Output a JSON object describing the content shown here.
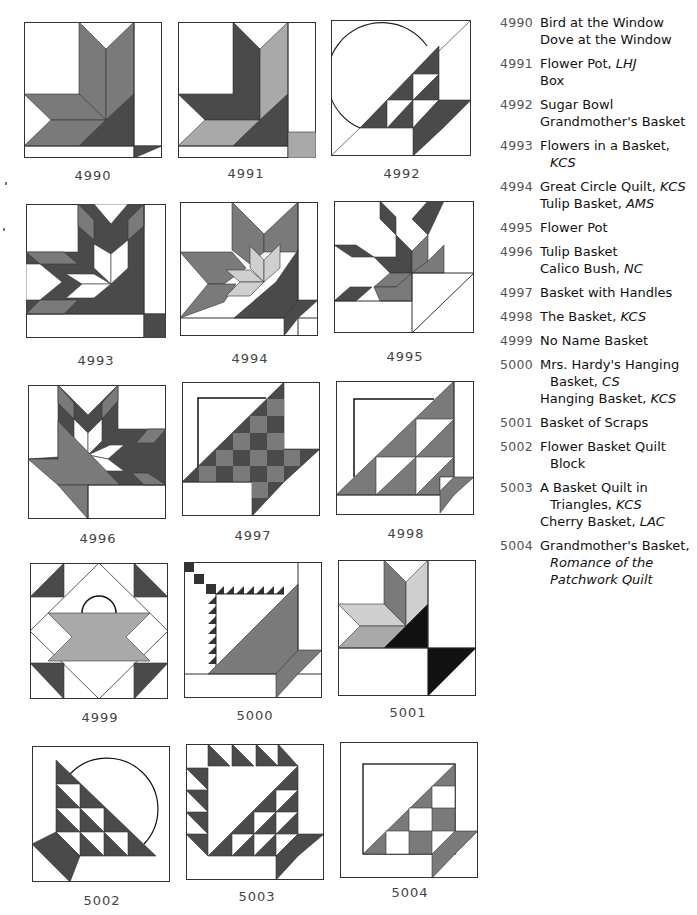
{
  "colors": {
    "dark": "#4a4a4a",
    "medium": "#7a7a7a",
    "light": "#a9a9a9",
    "pale": "#cfcfcf",
    "black": "#111111",
    "outline": "#333333",
    "background": "#ffffff"
  },
  "blocks": [
    {
      "number": "4990",
      "row": 0,
      "col": 0
    },
    {
      "number": "4991",
      "row": 0,
      "col": 1
    },
    {
      "number": "4992",
      "row": 0,
      "col": 2
    },
    {
      "number": "4993",
      "row": 1,
      "col": 0
    },
    {
      "number": "4994",
      "row": 1,
      "col": 1
    },
    {
      "number": "4995",
      "row": 1,
      "col": 2
    },
    {
      "number": "4996",
      "row": 2,
      "col": 0
    },
    {
      "number": "4997",
      "row": 2,
      "col": 1
    },
    {
      "number": "4998",
      "row": 2,
      "col": 2
    },
    {
      "number": "4999",
      "row": 3,
      "col": 0
    },
    {
      "number": "5000",
      "row": 3,
      "col": 1
    },
    {
      "number": "5001",
      "row": 3,
      "col": 2
    },
    {
      "number": "5002",
      "row": 4,
      "col": 0
    },
    {
      "number": "5003",
      "row": 4,
      "col": 1
    },
    {
      "number": "5004",
      "row": 4,
      "col": 2
    }
  ],
  "index": [
    {
      "number": "4990",
      "lines": [
        {
          "text": "Bird at the Window",
          "attr": ""
        },
        {
          "text": "Dove at the Window",
          "attr": ""
        }
      ]
    },
    {
      "number": "4991",
      "lines": [
        {
          "text": "Flower Pot, ",
          "attr": "LHJ"
        },
        {
          "text": "Box",
          "attr": ""
        }
      ]
    },
    {
      "number": "4992",
      "lines": [
        {
          "text": "Sugar Bowl",
          "attr": ""
        },
        {
          "text": "Grandmother's Basket",
          "attr": ""
        }
      ]
    },
    {
      "number": "4993",
      "lines": [
        {
          "text": "Flowers in a Basket,",
          "attr": ""
        },
        {
          "text": "",
          "attr": "KCS",
          "indent": true
        }
      ]
    },
    {
      "number": "4994",
      "lines": [
        {
          "text": "Great Circle Quilt, ",
          "attr": "KCS"
        },
        {
          "text": "Tulip Basket, ",
          "attr": "AMS"
        }
      ]
    },
    {
      "number": "4995",
      "lines": [
        {
          "text": "Flower Pot",
          "attr": ""
        }
      ]
    },
    {
      "number": "4996",
      "lines": [
        {
          "text": "Tulip Basket",
          "attr": ""
        },
        {
          "text": "Calico Bush, ",
          "attr": "NC"
        }
      ]
    },
    {
      "number": "4997",
      "lines": [
        {
          "text": "Basket with Handles",
          "attr": ""
        }
      ]
    },
    {
      "number": "4998",
      "lines": [
        {
          "text": "The Basket, ",
          "attr": "KCS"
        }
      ]
    },
    {
      "number": "4999",
      "lines": [
        {
          "text": "No Name Basket",
          "attr": ""
        }
      ]
    },
    {
      "number": "5000",
      "lines": [
        {
          "text": "Mrs. Hardy's Hanging",
          "attr": ""
        },
        {
          "text": "Basket, ",
          "attr": "CS",
          "indent": true
        },
        {
          "text": "Hanging Basket, ",
          "attr": "KCS"
        }
      ]
    },
    {
      "number": "5001",
      "lines": [
        {
          "text": "Basket of Scraps",
          "attr": ""
        }
      ]
    },
    {
      "number": "5002",
      "lines": [
        {
          "text": "Flower Basket Quilt",
          "attr": ""
        },
        {
          "text": "Block",
          "attr": "",
          "indent": true
        }
      ]
    },
    {
      "number": "5003",
      "lines": [
        {
          "text": "A Basket Quilt in",
          "attr": ""
        },
        {
          "text": "Triangles, ",
          "attr": "KCS",
          "indent": true
        },
        {
          "text": "Cherry Basket, ",
          "attr": "LAC"
        }
      ]
    },
    {
      "number": "5004",
      "lines": [
        {
          "text": "Grandmother's Basket,",
          "attr": ""
        },
        {
          "text": "",
          "attr": "Romance of the",
          "indent": true
        },
        {
          "text": "",
          "attr": "Patchwork Quilt",
          "indent": true
        }
      ]
    }
  ]
}
